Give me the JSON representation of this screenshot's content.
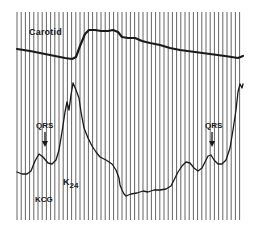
{
  "figure": {
    "labels": {
      "carotid": "Carotid",
      "qrs_left": "QRS",
      "qrs_right": "QRS",
      "kcg": "KCG",
      "k_main": "K",
      "k_sub": "24"
    },
    "colors": {
      "trace": "#1a1a1a",
      "grid": "#555555",
      "background": "#ffffff"
    },
    "grid": {
      "x_start": 17,
      "x_end": 243,
      "y_start": 12,
      "y_end": 220,
      "spacing": 4.2
    },
    "traces": {
      "carotid": "M17,49 L30,51 L45,54 L55,56 L65,58 L72,59 L76,57 L80,46 L85,34 L89,30 L95,30 L101,31 L108,31 L113,30 L118,32 L122,37 L128,38 L135,38 L142,41 L150,43 L160,45 L170,48 L180,50 L195,52 L210,54 L225,56 L238,58 L243,56",
      "kcg": "M17,172 L22,174 L27,174 L31,171 L35,161 L39,154 L43,157 L48,163 L52,164 L56,160 L59,150 L62,132 L65,112 L67,102 L69,110 L71,95 L73,83 L76,90 L79,98 L81,112 L84,128 L88,138 L92,146 L96,152 L100,157 L106,160 L112,164 L116,170 L119,178 L120,185 L122,190 L124,194 L126,196 L131,194 L137,193 L143,191 L148,192 L154,190 L160,190 L166,189 L171,186 L174,180 L178,172 L182,166 L186,162 L190,163 L194,168 L198,171 L202,168 L205,162 L208,156 L211,155 L214,160 L218,164 L222,164 L226,160 L230,148 L233,130 L236,110 L238,92 L240,84 L242,88 L243,84"
    },
    "arrows": [
      {
        "name": "qrs-left-arrow",
        "x": 45,
        "y1": 132,
        "y2": 146
      },
      {
        "name": "qrs-right-arrow",
        "x": 212,
        "y1": 132,
        "y2": 146
      }
    ]
  }
}
